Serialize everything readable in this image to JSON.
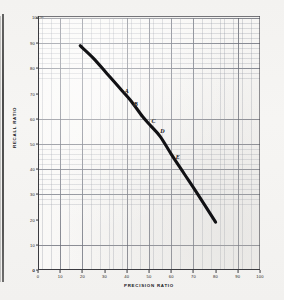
{
  "figure": {
    "unit_label": "100 %",
    "y_axis_title": "RECALL RATIO",
    "x_axis_title": "PRECISION RATIO"
  },
  "chart_data": {
    "type": "line",
    "title": "",
    "subtitle": "",
    "xlabel": "PRECISION RATIO",
    "ylabel": "RECALL RATIO",
    "xlim": [
      0,
      100
    ],
    "ylim": [
      0,
      100
    ],
    "xticks": [
      0,
      10,
      20,
      30,
      40,
      50,
      60,
      70,
      80,
      90,
      100
    ],
    "xticklabels": [
      "0",
      "10",
      "20",
      "30",
      "40",
      "50",
      "60",
      "70",
      "80",
      "90",
      "100"
    ],
    "yticks": [
      0,
      10,
      20,
      30,
      40,
      50,
      60,
      70,
      80,
      90,
      100
    ],
    "yticklabels": [
      "0",
      "10",
      "20",
      "30",
      "40",
      "50",
      "60",
      "70",
      "80",
      "90",
      "100"
    ],
    "grid": true,
    "grid_minor": true,
    "legend": false,
    "series": [
      {
        "name": "precision-recall curve",
        "color": "#111114",
        "x": [
          19,
          25,
          31,
          37,
          42,
          47,
          51,
          55,
          60,
          66,
          72,
          80
        ],
        "y": [
          89,
          84,
          78,
          72,
          67,
          61,
          57,
          53,
          46,
          38,
          30,
          19
        ]
      }
    ],
    "annotations": [
      {
        "label": "A",
        "x": 40,
        "y": 71
      },
      {
        "label": "B",
        "x": 44,
        "y": 66
      },
      {
        "label": "C",
        "x": 52,
        "y": 59
      },
      {
        "label": "D",
        "x": 56,
        "y": 55
      },
      {
        "label": "E",
        "x": 63,
        "y": 45
      }
    ]
  }
}
